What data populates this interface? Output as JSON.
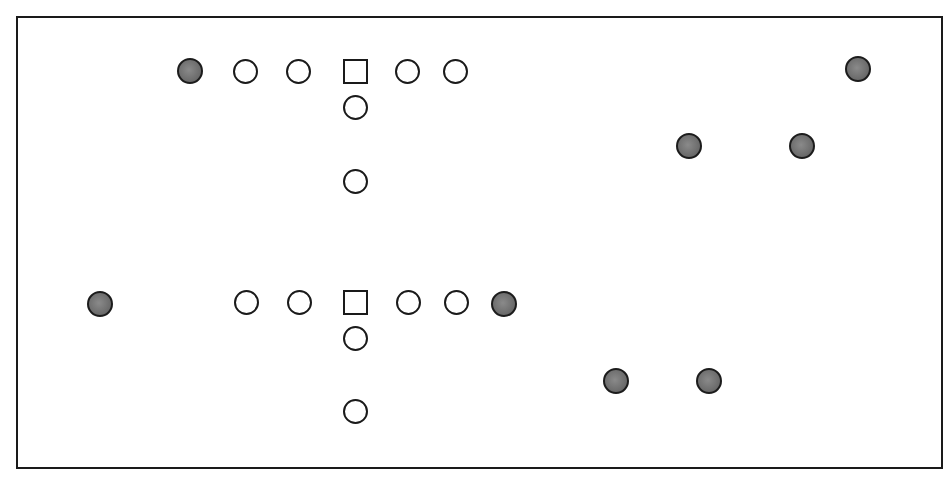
{
  "diagram": {
    "type": "formation-diagram",
    "frame": {
      "x": 16,
      "y": 16,
      "width": 927,
      "height": 453,
      "border_color": "#1a1a1a"
    },
    "colors": {
      "outline": "#1a1a1a",
      "filled_marker": "#707070",
      "background": "#ffffff"
    },
    "groups": [
      {
        "name": "top-formation",
        "markers": [
          {
            "shape": "circle-filled",
            "x": 190,
            "y": 71
          },
          {
            "shape": "circle-open",
            "x": 245,
            "y": 71
          },
          {
            "shape": "circle-open",
            "x": 298,
            "y": 71
          },
          {
            "shape": "square-open",
            "x": 355,
            "y": 71
          },
          {
            "shape": "circle-open",
            "x": 407,
            "y": 71
          },
          {
            "shape": "circle-open",
            "x": 455,
            "y": 71
          },
          {
            "shape": "circle-open",
            "x": 355,
            "y": 107
          },
          {
            "shape": "circle-open",
            "x": 355,
            "y": 181
          },
          {
            "shape": "circle-filled",
            "x": 858,
            "y": 69
          },
          {
            "shape": "circle-filled",
            "x": 689,
            "y": 146
          },
          {
            "shape": "circle-filled",
            "x": 802,
            "y": 146
          }
        ]
      },
      {
        "name": "bottom-formation",
        "markers": [
          {
            "shape": "circle-filled",
            "x": 100,
            "y": 304
          },
          {
            "shape": "circle-open",
            "x": 246,
            "y": 302
          },
          {
            "shape": "circle-open",
            "x": 299,
            "y": 302
          },
          {
            "shape": "square-open",
            "x": 355,
            "y": 302
          },
          {
            "shape": "circle-open",
            "x": 408,
            "y": 302
          },
          {
            "shape": "circle-open",
            "x": 456,
            "y": 302
          },
          {
            "shape": "circle-filled",
            "x": 504,
            "y": 304
          },
          {
            "shape": "circle-open",
            "x": 355,
            "y": 338
          },
          {
            "shape": "circle-open",
            "x": 355,
            "y": 411
          },
          {
            "shape": "circle-filled",
            "x": 616,
            "y": 381
          },
          {
            "shape": "circle-filled",
            "x": 709,
            "y": 381
          }
        ]
      }
    ],
    "legend": {
      "circle-open": "open circle marker",
      "circle-filled": "filled gray circle marker",
      "square-open": "open square marker"
    }
  }
}
